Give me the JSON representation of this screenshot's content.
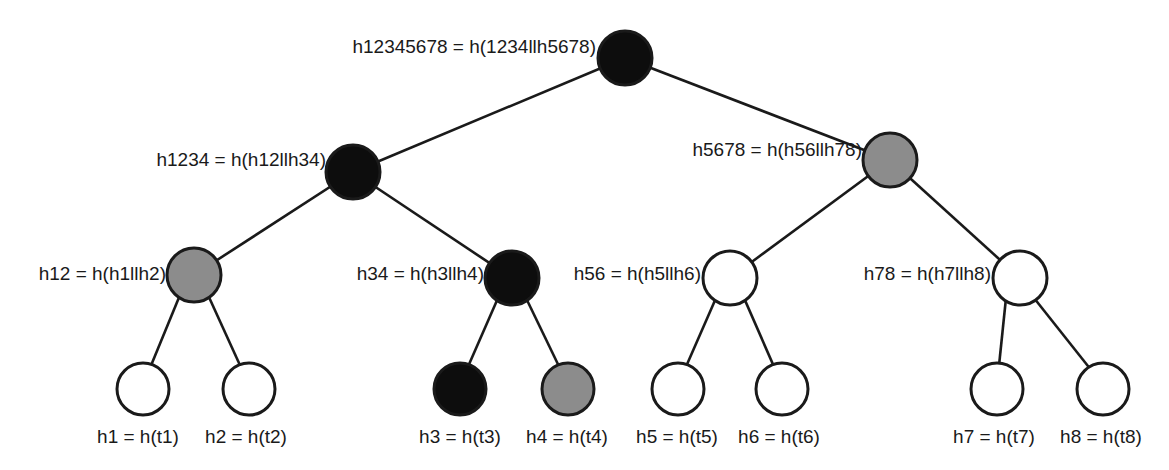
{
  "diagram": {
    "type": "merkle-tree",
    "colors": {
      "black": "#0d0d0d",
      "gray": "#8c8c8c",
      "white": "#ffffff",
      "stroke": "#1a1a1a"
    },
    "nodes": {
      "root": {
        "label": "h12345678 = h(1234llh5678)",
        "fill": "black"
      },
      "h1234": {
        "label": "h1234 = h(h12llh34)",
        "fill": "black"
      },
      "h5678": {
        "label": "h5678 = h(h56llh78)",
        "fill": "gray"
      },
      "h12": {
        "label": "h12 = h(h1llh2)",
        "fill": "gray"
      },
      "h34": {
        "label": "h34 = h(h3llh4)",
        "fill": "black"
      },
      "h56": {
        "label": "h56 = h(h5llh6)",
        "fill": "white"
      },
      "h78": {
        "label": "h78 = h(h7llh8)",
        "fill": "white"
      },
      "h1": {
        "label": "h1 = h(t1)",
        "fill": "white"
      },
      "h2": {
        "label": "h2 = h(t2)",
        "fill": "white"
      },
      "h3": {
        "label": "h3 = h(t3)",
        "fill": "black"
      },
      "h4": {
        "label": "h4 = h(t4)",
        "fill": "gray"
      },
      "h5": {
        "label": "h5 = h(t5)",
        "fill": "white"
      },
      "h6": {
        "label": "h6 = h(t6)",
        "fill": "white"
      },
      "h7": {
        "label": "h7 = h(t7)",
        "fill": "white"
      },
      "h8": {
        "label": "h8 = h(t8)",
        "fill": "white"
      }
    },
    "edges": [
      [
        "root",
        "h1234"
      ],
      [
        "root",
        "h5678"
      ],
      [
        "h1234",
        "h12"
      ],
      [
        "h1234",
        "h34"
      ],
      [
        "h5678",
        "h56"
      ],
      [
        "h5678",
        "h78"
      ],
      [
        "h12",
        "h1"
      ],
      [
        "h12",
        "h2"
      ],
      [
        "h34",
        "h3"
      ],
      [
        "h34",
        "h4"
      ],
      [
        "h56",
        "h5"
      ],
      [
        "h56",
        "h6"
      ],
      [
        "h78",
        "h7"
      ],
      [
        "h78",
        "h8"
      ]
    ]
  }
}
